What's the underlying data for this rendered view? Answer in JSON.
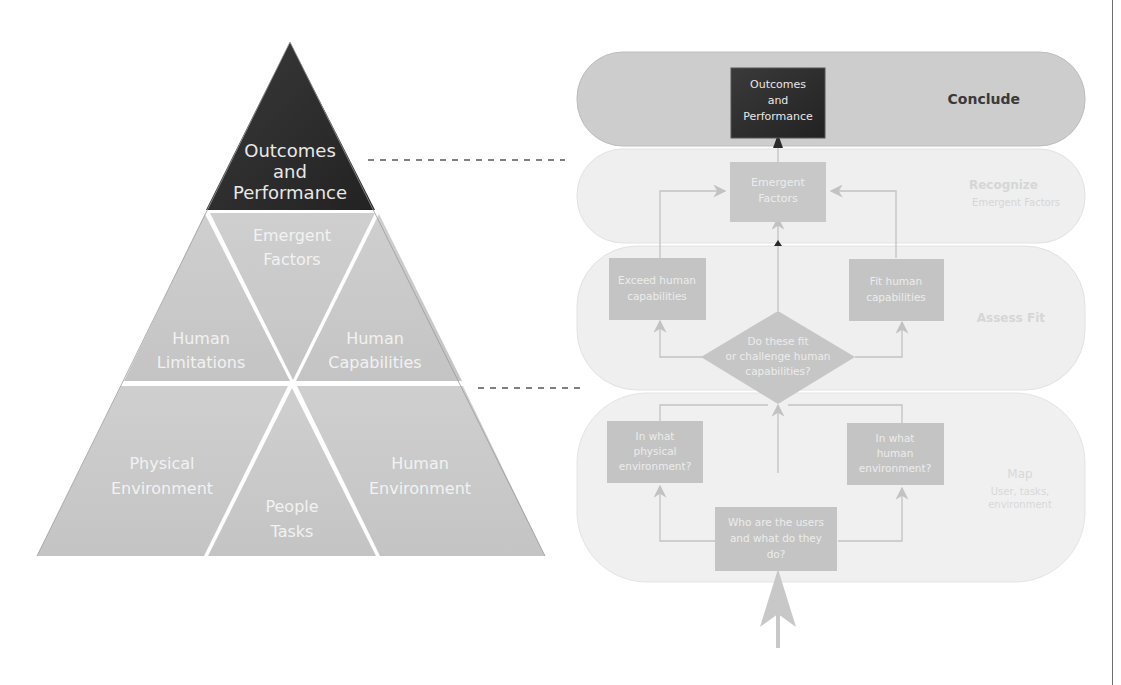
{
  "pyramid": {
    "apex": {
      "line1": "Outcomes",
      "line2": "and",
      "line3": "Performance"
    },
    "middle": {
      "left": {
        "line1": "Human",
        "line2": "Limitations"
      },
      "center": {
        "line1": "Emergent",
        "line2": "Factors"
      },
      "right": {
        "line1": "Human",
        "line2": "Capabilities"
      }
    },
    "bottom": {
      "left": {
        "line1": "Physical",
        "line2": "Environment"
      },
      "center": {
        "line1": "People",
        "line2": "Tasks"
      },
      "right": {
        "line1": "Human",
        "line2": "Environment"
      }
    }
  },
  "flowchart": {
    "bands": {
      "conclude": {
        "title": "Conclude"
      },
      "recognize": {
        "title": "Recognize",
        "subtitle": "Emergent Factors"
      },
      "assess": {
        "title": "Assess Fit"
      },
      "map": {
        "title": "Map",
        "subtitle1": "User, tasks,",
        "subtitle2": "environment"
      }
    },
    "boxes": {
      "outcomes": {
        "line1": "Outcomes",
        "line2": "and",
        "line3": "Performance"
      },
      "emergent": {
        "line1": "Emergent",
        "line2": "Factors"
      },
      "exceed": {
        "line1": "Exceed human",
        "line2": "capabilities"
      },
      "fit": {
        "line1": "Fit human",
        "line2": "capabilities"
      },
      "decision": {
        "line1": "Do these fit",
        "line2": "or challenge human",
        "line3": "capabilities?"
      },
      "physical": {
        "line1": "In what",
        "line2": "physical",
        "line3": "environment?"
      },
      "human_env": {
        "line1": "In what",
        "line2": "human",
        "line3": "environment?"
      },
      "users": {
        "line1": "Who are the users",
        "line2": "and what do they",
        "line3": "do?"
      }
    }
  },
  "colors": {
    "dark": "#2d2d2d",
    "pyramid_grey": "#c9c9c9",
    "box_grey": "#c4c4c4",
    "conclude_band": "#cdcdcd",
    "light_band": "#efefef",
    "line": "#bdbdbd",
    "dash": "#555555"
  }
}
